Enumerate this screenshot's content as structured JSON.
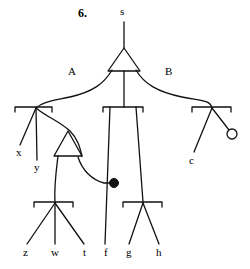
{
  "figure": {
    "number": "6.",
    "number_x": 78,
    "number_y": 13
  },
  "colors": {
    "ink": "#111111",
    "background": "#ffffff"
  },
  "tree": {
    "root_label": "s",
    "branch_labels": [
      {
        "text": "A",
        "x": 68,
        "y": 73
      },
      {
        "text": "B",
        "x": 165,
        "y": 73
      }
    ],
    "leaf_labels": [
      {
        "text": "x",
        "x": 16,
        "y": 152
      },
      {
        "text": "y",
        "x": 36,
        "y": 167
      },
      {
        "text": "c",
        "x": 190,
        "y": 160
      },
      {
        "text": "z",
        "x": 24,
        "y": 251
      },
      {
        "text": "w",
        "x": 54,
        "y": 251
      },
      {
        "text": "t",
        "x": 85,
        "y": 251
      },
      {
        "text": "f",
        "x": 106,
        "y": 251
      },
      {
        "text": "g",
        "x": 128,
        "y": 251
      },
      {
        "text": "h",
        "x": 158,
        "y": 251
      }
    ],
    "root": {
      "x": 124,
      "y": 11
    },
    "markers": {
      "filled_dot": {
        "x": 114,
        "y": 183,
        "r": 4.5,
        "fill": "#111111"
      },
      "open_circle": {
        "x": 232,
        "y": 134,
        "r": 5,
        "fill": "#ffffff"
      }
    },
    "triangles": [
      {
        "name": "top-triangle",
        "apex_x": 124,
        "apex_y": 48,
        "left_x": 108,
        "right_x": 140,
        "base_y": 71
      },
      {
        "name": "lower-triangle",
        "apex_x": 68,
        "apex_y": 131,
        "left_x": 54,
        "right_x": 82,
        "base_y": 156
      }
    ],
    "brackets": [
      {
        "name": "bracket-left",
        "x1": 15,
        "x2": 52,
        "y": 107,
        "tick": 5,
        "node_x": 36
      },
      {
        "name": "bracket-center",
        "x1": 103,
        "x2": 143,
        "y": 107,
        "tick": 5,
        "node_x": 124
      },
      {
        "name": "bracket-right",
        "x1": 192,
        "x2": 231,
        "y": 107,
        "tick": 5,
        "node_x": 212
      },
      {
        "name": "bracket-bottom-left",
        "x1": 34,
        "x2": 73,
        "y": 202,
        "tick": 5,
        "node_x": 55
      },
      {
        "name": "bracket-bottom-right",
        "x1": 123,
        "x2": 162,
        "y": 202,
        "tick": 5,
        "node_x": 143
      }
    ]
  }
}
